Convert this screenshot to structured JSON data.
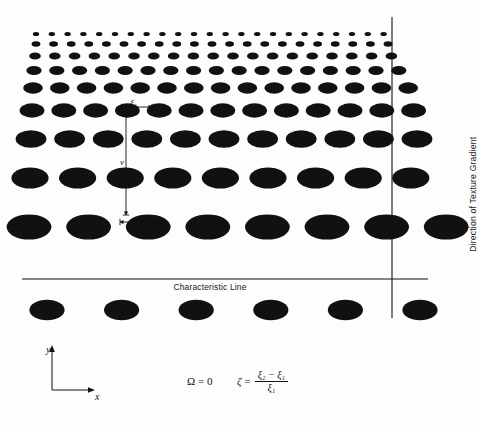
{
  "figure": {
    "background_color": "#fdfdfd",
    "ink_color": "#111111"
  },
  "annotations": {
    "characteristic_line": "Characteristic Line",
    "gradient_direction": "Direction of Texture Gradient",
    "xi1": "ξ",
    "xi1_sub": "1",
    "xi2": "ξ",
    "xi2_sub": "2",
    "spacing_v": "v",
    "axis_y": "y",
    "axis_x": "x"
  },
  "equations": {
    "omega_symbol": "Ω",
    "omega_equals": "=",
    "omega_value": "0",
    "zeta_symbol": "ζ",
    "zeta_equals": "=",
    "numerator": "ξ₂ − ξ₁",
    "denominator": "ξ₁"
  },
  "chart_data": {
    "type": "scatter",
    "xlabel": "x",
    "ylabel": "y",
    "xlim": [
      0,
      479
    ],
    "ylim": [
      0,
      432
    ],
    "grid": false,
    "legend": "none",
    "rows": [
      {
        "cy": 34.0,
        "rx": 3.2,
        "ry": 2.1,
        "spacing": 15.8,
        "x_start": 36.0,
        "count": 23
      },
      {
        "cy": 44.0,
        "rx": 4.4,
        "ry": 2.8,
        "spacing": 17.6,
        "x_start": 36.0,
        "count": 21
      },
      {
        "cy": 56.0,
        "rx": 5.8,
        "ry": 3.6,
        "spacing": 19.8,
        "x_start": 35.0,
        "count": 19
      },
      {
        "cy": 70.5,
        "rx": 7.6,
        "ry": 4.6,
        "spacing": 22.8,
        "x_start": 34.0,
        "count": 17
      },
      {
        "cy": 88.0,
        "rx": 9.8,
        "ry": 5.8,
        "spacing": 26.8,
        "x_start": 33.0,
        "count": 15
      },
      {
        "cy": 110.5,
        "rx": 12.4,
        "ry": 7.2,
        "spacing": 31.8,
        "x_start": 32.0,
        "count": 13
      },
      {
        "cy": 139.0,
        "rx": 15.4,
        "ry": 8.8,
        "spacing": 38.6,
        "x_start": 31.0,
        "count": 11
      },
      {
        "cy": 178.0,
        "rx": 18.6,
        "ry": 10.6,
        "spacing": 47.6,
        "x_start": 30.0,
        "count": 9
      },
      {
        "cy": 227.0,
        "rx": 22.4,
        "ry": 12.6,
        "spacing": 59.6,
        "x_start": 29.0,
        "count": 8
      },
      {
        "cy": 310.0,
        "rx": 17.6,
        "ry": 10.2,
        "spacing": 74.6,
        "x_start": 47.0,
        "count": 6
      }
    ],
    "vertical_line": {
      "x": 392.0,
      "y_top": 17.0,
      "y_bottom": 318.0
    },
    "horizontal_line": {
      "y": 279.0,
      "x_left": 22.0,
      "x_right": 428.0
    },
    "measure_v": {
      "x": 126.0,
      "y_top": 113.0,
      "y_bottom": 215.0
    },
    "measure_xi1": {
      "y": 107.0,
      "x_left": 122.0,
      "x_right": 152.0
    },
    "measure_xi2": {
      "y": 222.0,
      "x_left": 120.0,
      "x_right": 158.0
    },
    "axis_origin": {
      "x": 52.0,
      "y": 390.0
    },
    "axis_y_top": 348.0,
    "axis_x_right": 92.0
  }
}
